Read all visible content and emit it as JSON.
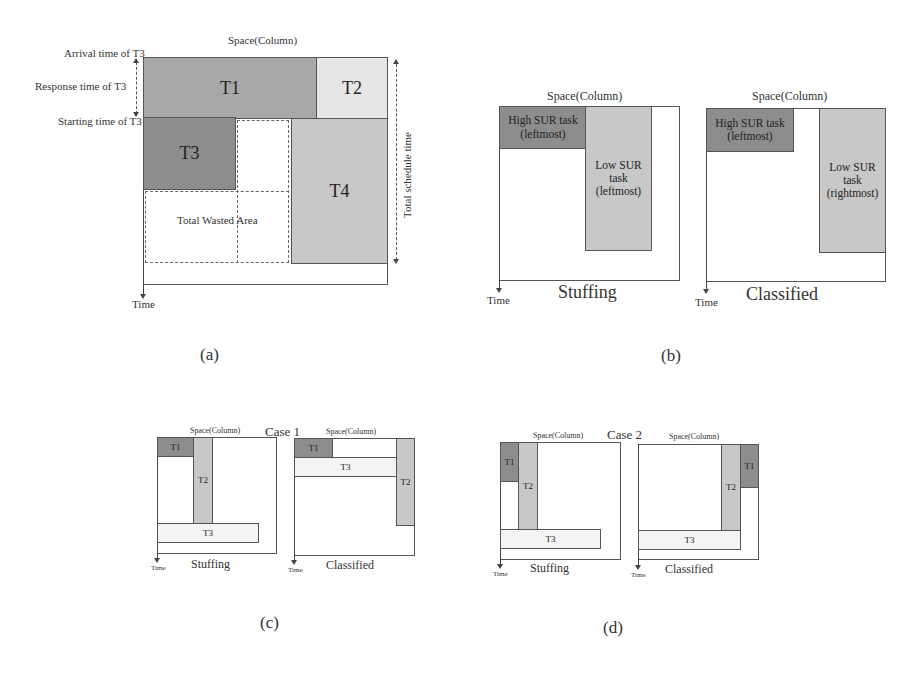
{
  "panel_a": {
    "caption": "(a)",
    "space_label": "Space(Column)",
    "time_label": "Time",
    "arrival_label": "Arrival time of T3",
    "response_label": "Response time of T3",
    "starting_label": "Starting time of T3",
    "total_schedule_label": "Total schedule time",
    "wasted_area_label": "Total Wasted Area",
    "tasks": {
      "t1": "T1",
      "t2": "T2",
      "t3": "T3",
      "t4": "T4"
    }
  },
  "panel_b": {
    "caption": "(b)",
    "stuffing": {
      "space_label": "Space(Column)",
      "time_label": "Time",
      "title": "Stuffing",
      "high_task": [
        "High SUR task",
        "(leftmost)"
      ],
      "low_task": [
        "Low SUR",
        "task",
        "(leftmost)"
      ]
    },
    "classified": {
      "space_label": "Space(Column)",
      "time_label": "Time",
      "title": "Classified",
      "high_task": [
        "High SUR task",
        "(leftmost)"
      ],
      "low_task": [
        "Low SUR",
        "task",
        "(rightmost)"
      ]
    }
  },
  "panel_c": {
    "caption": "(c)",
    "case_label": "Case 1",
    "stuffing": {
      "space_label": "Space(Column)",
      "time_label": "Time",
      "title": "Stuffing",
      "t1": "T1",
      "t2": "T2",
      "t3": "T3"
    },
    "classified": {
      "space_label": "Space(Column)",
      "time_label": "Time",
      "title": "Classified",
      "t1": "T1",
      "t2": "T2",
      "t3": "T3"
    }
  },
  "panel_d": {
    "caption": "(d)",
    "case_label": "Case 2",
    "stuffing": {
      "space_label": "Space(Column)",
      "time_label": "Time",
      "title": "Stuffing",
      "t1": "T1",
      "t2": "T2",
      "t3": "T3"
    },
    "classified": {
      "space_label": "Space(Column)",
      "time_label": "Time",
      "title": "Classified",
      "t1": "T1",
      "t2": "T2",
      "t3": "T3"
    }
  },
  "colors": {
    "dark_task": "#8d8d8d",
    "mid_task": "#a8a8a8",
    "light_task": "#c8c8c8",
    "pale_task": "#e6e6e6",
    "border": "#555555"
  }
}
